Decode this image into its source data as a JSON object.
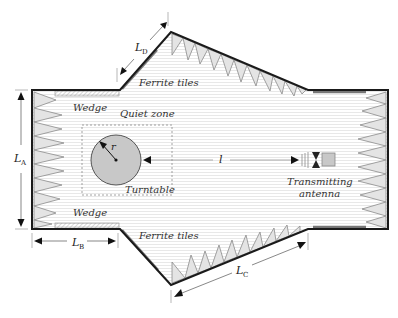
{
  "diagram": {
    "labels": {
      "ferrite_top": "Ferrite tiles",
      "ferrite_bottom": "Ferrite tiles",
      "wedge_top": "Wedge",
      "wedge_bottom": "Wedge",
      "quiet_zone": "Quiet zone",
      "turntable": "Turntable",
      "radius": "r",
      "distance": "l",
      "antenna_line1": "Transmitting",
      "antenna_line2": "antenna"
    },
    "dimensions": {
      "LA": {
        "main": "L",
        "sub": "A"
      },
      "LB": {
        "main": "L",
        "sub": "B"
      },
      "LC": {
        "main": "L",
        "sub": "C"
      },
      "LD": {
        "main": "L",
        "sub": "D"
      }
    },
    "colors": {
      "wall": "#1a1a1a",
      "absorber_fill": "#e4e4e4",
      "absorber_stroke": "#8a8a8a",
      "ferrite": "#777777",
      "turntable_fill": "#c8c8c8",
      "hatch_line": "#e6e6e6",
      "antenna_box": "#c8c8c8"
    }
  }
}
